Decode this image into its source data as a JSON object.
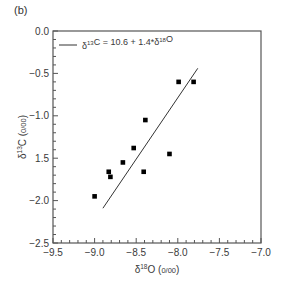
{
  "panel_label": "(b)",
  "chart_data": {
    "type": "scatter",
    "title": "",
    "xlabel": "δ18O (0/00)",
    "ylabel": "δ13C (0/00)",
    "xlim": [
      -9.5,
      -7.0
    ],
    "ylim": [
      -2.5,
      0.0
    ],
    "x_ticks": [
      -9.5,
      -9.0,
      -8.5,
      -8.0,
      -7.5,
      -7.0
    ],
    "x_tick_labels": [
      "−9.5",
      "−9.0",
      "−8.5",
      "−8.0",
      "−7.5",
      "−7.0"
    ],
    "y_ticks": [
      0.0,
      -0.5,
      -1.0,
      -1.5,
      -2.0,
      -2.5
    ],
    "y_tick_labels": [
      "0.0",
      "−0.5",
      "−1.0",
      "1.5",
      "−2.0",
      "−2.5"
    ],
    "grid": false,
    "legend_position": "upper left",
    "series": [
      {
        "name": "samples",
        "marker": "square",
        "color": "#000000",
        "points": [
          {
            "x": -9.0,
            "y": -1.95
          },
          {
            "x": -8.83,
            "y": -1.66
          },
          {
            "x": -8.81,
            "y": -1.72
          },
          {
            "x": -8.66,
            "y": -1.55
          },
          {
            "x": -8.53,
            "y": -1.38
          },
          {
            "x": -8.39,
            "y": -1.05
          },
          {
            "x": -8.41,
            "y": -1.66
          },
          {
            "x": -8.1,
            "y": -1.45
          },
          {
            "x": -7.99,
            "y": -0.6
          },
          {
            "x": -7.81,
            "y": -0.6
          }
        ]
      },
      {
        "name": "δ13C = 10.6 + 1.4*δ18O",
        "type": "line",
        "color": "#333333",
        "points": [
          {
            "x": -8.9,
            "y": -2.09
          },
          {
            "x": -7.76,
            "y": -0.44
          }
        ]
      }
    ]
  },
  "legend": {
    "label_prefix": "δ",
    "label_sup1": "13",
    "label_mid": "C = 10.6 + 1.4*δ",
    "label_sup2": "18",
    "label_end": "O"
  },
  "axes": {
    "x_label_main": "δ",
    "x_label_sup": "18",
    "x_label_end": "O (",
    "x_label_unit": "0/00",
    "x_label_close": ")",
    "y_label_main": "δ",
    "y_label_sup": "13",
    "y_label_end": "C (",
    "y_label_unit": "0/00",
    "y_label_close": ")"
  }
}
